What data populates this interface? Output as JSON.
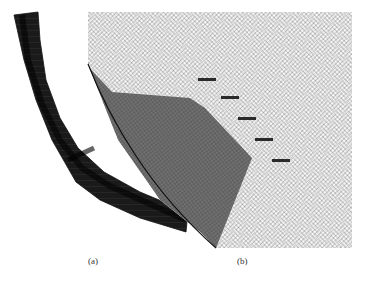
{
  "figure": {
    "panels": [
      {
        "id": "a",
        "label": "(a)",
        "content": "curved-duct-mesh"
      },
      {
        "id": "b",
        "label": "(b)",
        "content": "zoomed-structured-mesh-with-shaded-surface-and-5-markers"
      }
    ],
    "colors": {
      "background": "#ffffff",
      "mesh_line": "#222222",
      "dark_band": "#111111",
      "shaded_surface": "#6a6a6a",
      "marker": "#2a2a2a"
    },
    "markers_count": 5
  }
}
